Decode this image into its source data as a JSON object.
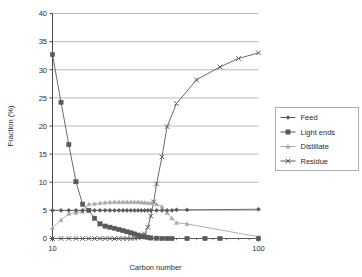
{
  "chart_data": {
    "type": "line",
    "title": "",
    "xlabel": "Carbon number",
    "ylabel": "Fraction (%)",
    "xscale": "log",
    "xlim": [
      10,
      100
    ],
    "xticks": [
      10,
      100
    ],
    "xticklabels": [
      "10",
      "100"
    ],
    "ylim": [
      0,
      40
    ],
    "yticks": [
      0,
      5,
      10,
      15,
      20,
      25,
      30,
      35,
      40
    ],
    "yticklabels": [
      "0",
      "5",
      "10",
      "15",
      "20",
      "25",
      "30",
      "35",
      "40"
    ],
    "grid": "horizontal",
    "legend_position": "right-outside",
    "series": [
      {
        "name": "Feed",
        "marker": "diamond",
        "color": "#595959",
        "x": [
          10,
          11,
          12,
          13,
          14,
          15,
          16,
          17,
          18,
          19,
          20,
          21,
          22,
          23,
          24,
          25,
          26,
          27,
          28,
          29,
          30,
          32,
          34,
          36,
          38,
          40,
          45,
          100
        ],
        "y": [
          5.0,
          5.0,
          5.0,
          5.0,
          5.0,
          5.0,
          5.0,
          5.0,
          5.0,
          5.0,
          5.0,
          5.0,
          5.0,
          5.0,
          5.0,
          5.0,
          5.0,
          5.0,
          5.0,
          5.0,
          5.0,
          5.0,
          5.0,
          5.0,
          5.0,
          5.1,
          5.1,
          5.2
        ]
      },
      {
        "name": "Light ends",
        "marker": "square",
        "color": "#595959",
        "x": [
          10,
          11,
          12,
          13,
          14,
          15,
          16,
          17,
          18,
          19,
          20,
          21,
          22,
          23,
          24,
          25,
          26,
          27,
          28,
          29,
          30,
          32,
          34,
          36,
          38,
          45,
          55,
          65,
          100
        ],
        "y": [
          32.7,
          24.2,
          16.7,
          10.1,
          6.1,
          5.0,
          3.6,
          2.6,
          2.2,
          2.0,
          1.8,
          1.6,
          1.4,
          1.2,
          1.0,
          0.8,
          0.6,
          0.45,
          0.3,
          0.2,
          0.1,
          0.05,
          0.0,
          0.0,
          0.0,
          0.0,
          0.0,
          0.0,
          0.0
        ]
      },
      {
        "name": "Distillate",
        "marker": "triangle",
        "color": "#a8a8a8",
        "x": [
          10,
          11,
          12,
          13,
          14,
          15,
          16,
          17,
          18,
          19,
          20,
          21,
          22,
          23,
          24,
          25,
          26,
          27,
          28,
          29,
          30,
          32,
          34,
          36,
          38,
          40,
          45,
          100
        ],
        "y": [
          1.9,
          3.3,
          4.4,
          4.6,
          4.8,
          6.1,
          6.2,
          6.3,
          6.4,
          6.45,
          6.5,
          6.5,
          6.5,
          6.5,
          6.5,
          6.5,
          6.5,
          6.45,
          6.4,
          6.35,
          6.3,
          6.1,
          5.7,
          4.6,
          3.6,
          2.8,
          2.6,
          0.3
        ]
      },
      {
        "name": "Residue",
        "marker": "cross",
        "color": "#595959",
        "x": [
          10,
          11,
          12,
          13,
          14,
          15,
          16,
          17,
          18,
          19,
          20,
          21,
          22,
          23,
          24,
          25,
          26,
          27,
          28,
          29,
          30,
          31,
          32,
          34,
          36,
          40,
          50,
          65,
          80,
          100
        ],
        "y": [
          0.0,
          0.0,
          0.0,
          0.0,
          0.0,
          0.0,
          0.0,
          0.0,
          0.0,
          0.0,
          0.0,
          0.0,
          0.0,
          0.0,
          0.0,
          0.05,
          0.1,
          0.3,
          0.8,
          2.0,
          4.0,
          6.5,
          9.7,
          14.5,
          19.9,
          24.0,
          28.2,
          30.5,
          32.0,
          33.0
        ]
      }
    ]
  },
  "legend": {
    "items": [
      {
        "label": "Feed",
        "marker": "diamond",
        "color": "#595959"
      },
      {
        "label": "Light ends",
        "marker": "square",
        "color": "#595959"
      },
      {
        "label": "Distillate",
        "marker": "triangle",
        "color": "#a8a8a8"
      },
      {
        "label": "Residue",
        "marker": "cross",
        "color": "#595959"
      }
    ]
  },
  "colors": {
    "background": "#ffffff",
    "grid": "#8c8c8c",
    "axis": "#4a4a4a",
    "text": "#2b2b2b",
    "series_dark": "#595959",
    "series_light": "#a8a8a8"
  }
}
